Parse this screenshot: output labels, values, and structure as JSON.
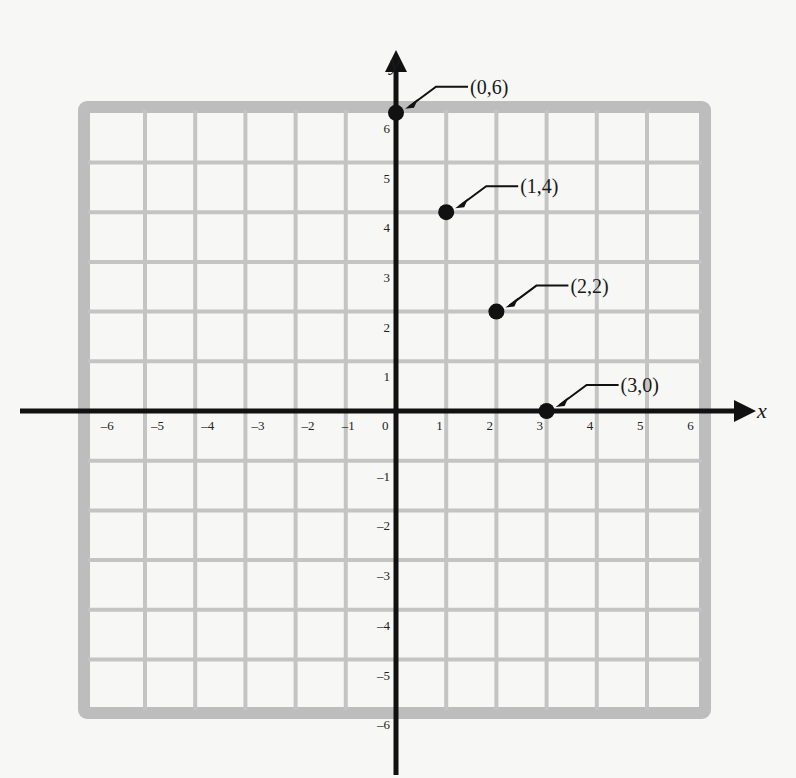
{
  "chart_data": {
    "type": "scatter",
    "title": "",
    "xlabel": "x",
    "ylabel": "y",
    "xlim": [
      -6,
      6
    ],
    "ylim": [
      -6,
      6
    ],
    "grid": true,
    "x_ticks": [
      "-6",
      "-5",
      "-4",
      "-3",
      "-2",
      "-1",
      "0",
      "1",
      "2",
      "3",
      "4",
      "5",
      "6"
    ],
    "y_ticks": [
      "6",
      "5",
      "4",
      "3",
      "2",
      "1",
      "-1",
      "-2",
      "-3",
      "-4",
      "-5",
      "-6"
    ],
    "series": [
      {
        "name": "points",
        "points": [
          {
            "x": 0,
            "y": 6,
            "label": "(0,6)"
          },
          {
            "x": 1,
            "y": 4,
            "label": "(1,4)"
          },
          {
            "x": 2,
            "y": 2,
            "label": "(2,2)"
          },
          {
            "x": 3,
            "y": 0,
            "label": "(3,0)"
          }
        ]
      }
    ],
    "annotations": [
      "(0,6)",
      "(1,4)",
      "(2,2)",
      "(3,0)"
    ]
  },
  "colors": {
    "grid": "#c4c4c4",
    "border": "#bdbdbd",
    "axis": "#111111",
    "point": "#111111",
    "background": "#f7f7f5"
  }
}
